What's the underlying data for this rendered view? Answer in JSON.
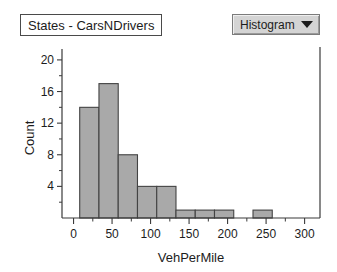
{
  "title_box": {
    "label": "States - CarsNDrivers"
  },
  "chart_type_selector": {
    "label": "Histogram",
    "caret_icon": "chevron-down-icon"
  },
  "chart_data": {
    "type": "bar",
    "title": "States - CarsNDrivers",
    "xlabel": "VehPerMile",
    "ylabel": "Count",
    "xlim": [
      -15,
      320
    ],
    "ylim": [
      0,
      21
    ],
    "grid": false,
    "legend": null,
    "x_ticks": [
      0,
      50,
      100,
      150,
      200,
      250,
      300
    ],
    "x_tick_labels": [
      "0",
      "50",
      "100",
      "150",
      "200",
      "250",
      "300"
    ],
    "x_minor_step": 25,
    "y_ticks": [
      4,
      8,
      12,
      16,
      20
    ],
    "y_tick_labels": [
      "4",
      "8",
      "12",
      "16",
      "20"
    ],
    "y_minor_step": 2,
    "bin_width": 25,
    "bins": [
      {
        "start": 8,
        "end": 33,
        "count": 14
      },
      {
        "start": 33,
        "end": 58,
        "count": 17
      },
      {
        "start": 58,
        "end": 83,
        "count": 8
      },
      {
        "start": 83,
        "end": 108,
        "count": 4
      },
      {
        "start": 108,
        "end": 133,
        "count": 4
      },
      {
        "start": 133,
        "end": 158,
        "count": 1
      },
      {
        "start": 158,
        "end": 183,
        "count": 1
      },
      {
        "start": 183,
        "end": 208,
        "count": 1
      },
      {
        "start": 233,
        "end": 258,
        "count": 1
      }
    ],
    "categories": [
      "8-33",
      "33-58",
      "58-83",
      "83-108",
      "108-133",
      "133-158",
      "158-183",
      "183-208",
      "233-258"
    ],
    "values": [
      14,
      17,
      8,
      4,
      4,
      1,
      1,
      1,
      1
    ],
    "colors": {
      "bar_fill": "#a9a9a9",
      "bar_stroke": "#434343",
      "axis": "#3a3a3a",
      "background": "#ffffff",
      "dropdown_face": "#d4d4d4"
    }
  }
}
